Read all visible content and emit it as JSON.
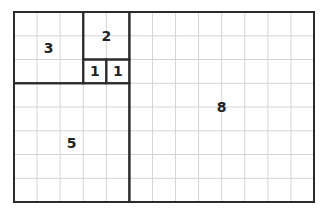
{
  "diagram": {
    "grid": {
      "cols": 13,
      "rows": 8,
      "x0": 14,
      "y0": 12,
      "x1": 314,
      "y1": 202,
      "grid_color": "#d4d4d4",
      "line_color": "#2b2b2b"
    },
    "squares": [
      {
        "label": "3",
        "col": 0,
        "row": 0,
        "size": 3
      },
      {
        "label": "2",
        "col": 3,
        "row": 0,
        "size": 2
      },
      {
        "label": "1",
        "col": 3,
        "row": 2,
        "size": 1
      },
      {
        "label": "1",
        "col": 4,
        "row": 2,
        "size": 1
      },
      {
        "label": "5",
        "col": 0,
        "row": 3,
        "size": 5
      },
      {
        "label": "8",
        "col": 5,
        "row": 0,
        "size": 8
      }
    ]
  }
}
